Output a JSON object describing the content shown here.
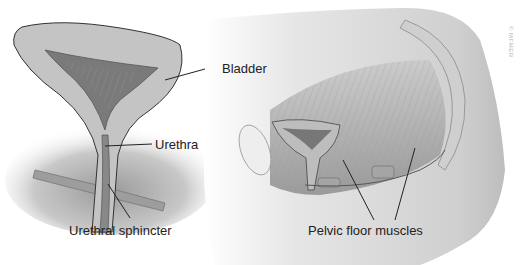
{
  "labels": {
    "bladder": "Bladder",
    "urethra": "Urethra",
    "urethral_sphincter": "Urethral sphincter",
    "pelvic_floor_muscles": "Pelvic floor muscles"
  },
  "watermark": "© MFMER",
  "colors": {
    "background": "#ffffff",
    "tissue_light": "#d9d9d9",
    "tissue_mid": "#a8a8a8",
    "tissue_dark": "#6e6e6e",
    "outline": "#3a3a3a",
    "leader_line": "#222222",
    "label_text": "#222222"
  }
}
